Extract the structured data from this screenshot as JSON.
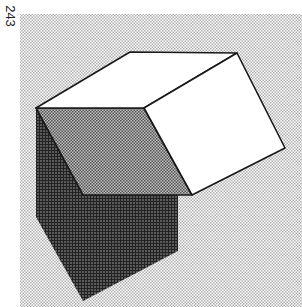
{
  "page": {
    "number": "243"
  },
  "figure": {
    "colors": {
      "background_dot": "#b8b8b8",
      "background_base": "#ffffff",
      "face_light": "#ffffff",
      "face_medium": "#8a8a8a",
      "shadow_dark": "#4a4a4a",
      "outline": "#1a1a1a"
    }
  }
}
